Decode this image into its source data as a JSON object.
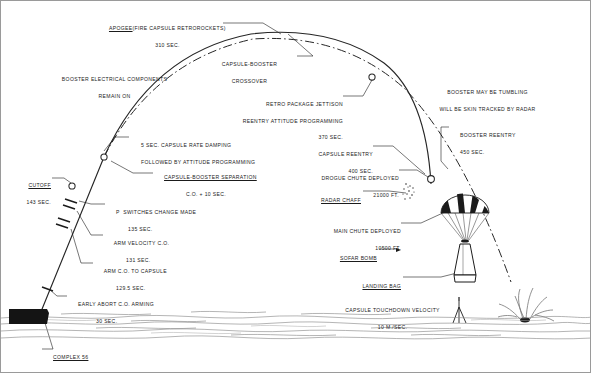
{
  "diagram": {
    "colors": {
      "ink": "#1b1b1b",
      "trajectory": "#262626",
      "wave": "#8d8d8d",
      "pad": "#141414"
    }
  },
  "labels": {
    "apogee": {
      "line1": "APOGEE",
      "line2": "(FIRE CAPSULE RETROROCKETS)",
      "line3": "310 SEC."
    },
    "crossover": {
      "line1": "CAPSULE-BOOSTER",
      "line2": "CROSSOVER"
    },
    "booster_electrical": {
      "line1": "BOOSTER ELECTRICAL COMPONENTS",
      "line2": "REMAIN ON"
    },
    "retro_jettison": {
      "line1": "RETRO PACKAGE JETTISON",
      "line2": "REENTRY ATTITUDE PROGRAMMING",
      "line3": "370 SEC."
    },
    "booster_tumbling": {
      "line1": "BOOSTER MAY BE TUMBLING",
      "line2": "WILL BE SKIN TRACKED BY RADAR"
    },
    "booster_reentry": {
      "line1": "BOOSTER REENTRY",
      "line2": "450 SEC."
    },
    "capsule_reentry": {
      "line1": "CAPSULE REENTRY",
      "line2": "400 SEC."
    },
    "rate_damping": {
      "line1": "5 SEC. CAPSULE RATE DAMPING",
      "line2": "FOLLOWED BY ATTITUDE PROGRAMMING"
    },
    "separation": {
      "line1": "CAPSULE-BOOSTER SEPARATION",
      "line2": "C.O. + 10 SEC."
    },
    "cutoff": {
      "line1": "CUTOFF",
      "line2": "143 SEC."
    },
    "pc_switches": {
      "line1": "P  SWITCHES CHANGE MADE",
      "line2": "135 SEC.",
      "sub": "C"
    },
    "arm_velocity": {
      "line1": "ARM VELOCITY C.O.",
      "line2": "131 SEC."
    },
    "arm_co_capsule": {
      "line1": "ARM C.O. TO CAPSULE",
      "line2": "129.5 SEC."
    },
    "early_abort": {
      "line1": "EARLY ABORT C.O. ARMING",
      "line2": "30 SEC."
    },
    "complex": {
      "line1": "COMPLEX 56",
      "line2": "PAD 5"
    },
    "drogue": {
      "line1": "DROGUE CHUTE DEPLOYED",
      "line2": "21000 FT."
    },
    "radar_chaff": {
      "line1": "RADAR CHAFF"
    },
    "main_chute": {
      "line1": "MAIN CHUTE DEPLOYED",
      "line2": "10500 FT."
    },
    "sofar_bomb": {
      "line1": "SOFAR BOMB"
    },
    "landing_bag": {
      "line1": "LANDING BAG"
    },
    "touchdown": {
      "line1": "CAPSULE TOUCHDOWN VELOCITY",
      "line2": "10 M./SEC."
    }
  }
}
